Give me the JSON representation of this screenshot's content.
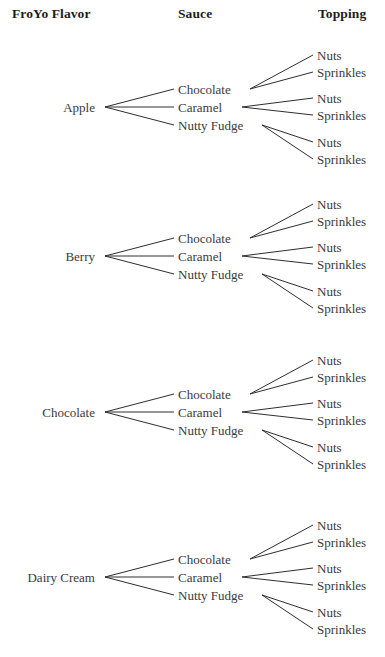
{
  "headers": {
    "froyo": "FroYo Flavor",
    "sauce": "Sauce",
    "topping": "Topping"
  },
  "style": {
    "line_color": "#2e2e2e",
    "text_color": "#3a3a3a",
    "header_color": "#1d1d1d",
    "background": "#ffffff"
  },
  "layout": {
    "root_right_x": 100,
    "root_vertex_x": 105,
    "sauce_label_x": 178,
    "topping_label_x": 317,
    "topping_line_end_x": 313,
    "sauce_vertex_x": [
      250,
      242,
      262
    ],
    "group_root_y": [
      107,
      256,
      412,
      577
    ],
    "sauce_offsets": [
      -18,
      0,
      18
    ],
    "topping_offsets": [
      -52,
      -35,
      -9,
      8,
      35,
      52
    ]
  },
  "chart_data": {
    "type": "tree",
    "title": "",
    "levels": [
      "FroYo Flavor",
      "Sauce",
      "Topping"
    ],
    "counts": {
      "flavors": 4,
      "sauces": 3,
      "toppings": 2,
      "outcomes": 24
    },
    "groups": [
      {
        "flavor": "Apple",
        "root_y": 107,
        "sauces": [
          {
            "label": "Chocolate",
            "toppings": [
              "Nuts",
              "Sprinkles"
            ]
          },
          {
            "label": "Caramel",
            "toppings": [
              "Nuts",
              "Sprinkles"
            ]
          },
          {
            "label": "Nutty Fudge",
            "toppings": [
              "Nuts",
              "Sprinkles"
            ]
          }
        ]
      },
      {
        "flavor": "Berry",
        "root_y": 256,
        "sauces": [
          {
            "label": "Chocolate",
            "toppings": [
              "Nuts",
              "Sprinkles"
            ]
          },
          {
            "label": "Caramel",
            "toppings": [
              "Nuts",
              "Sprinkles"
            ]
          },
          {
            "label": "Nutty Fudge",
            "toppings": [
              "Nuts",
              "Sprinkles"
            ]
          }
        ]
      },
      {
        "flavor": "Chocolate",
        "root_y": 412,
        "sauces": [
          {
            "label": "Chocolate",
            "toppings": [
              "Nuts",
              "Sprinkles"
            ]
          },
          {
            "label": "Caramel",
            "toppings": [
              "Nuts",
              "Sprinkles"
            ]
          },
          {
            "label": "Nutty Fudge",
            "toppings": [
              "Nuts",
              "Sprinkles"
            ]
          }
        ]
      },
      {
        "flavor": "Dairy Cream",
        "root_y": 577,
        "sauces": [
          {
            "label": "Chocolate",
            "toppings": [
              "Nuts",
              "Sprinkles"
            ]
          },
          {
            "label": "Caramel",
            "toppings": [
              "Nuts",
              "Sprinkles"
            ]
          },
          {
            "label": "Nutty Fudge",
            "toppings": [
              "Nuts",
              "Sprinkles"
            ]
          }
        ]
      }
    ]
  }
}
